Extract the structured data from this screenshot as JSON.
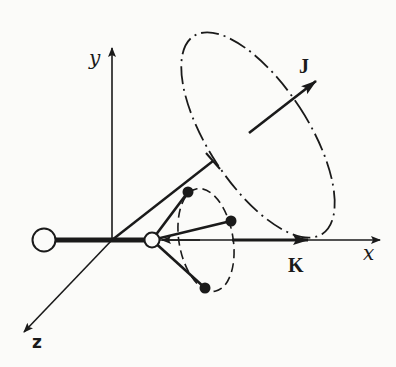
{
  "figure": {
    "labels": {
      "y_axis": "y",
      "x_axis": "x",
      "z_axis": "z",
      "angular_momentum": "J",
      "projection": "K"
    },
    "colors": {
      "ink": "#1a1a1a",
      "paper": "#fbfbf9"
    },
    "elements": {
      "axes": [
        "x",
        "y",
        "z"
      ],
      "large_atom": "open circle on negative x side",
      "central_atom": "small open circle on x axis",
      "outer_atoms": 3,
      "large_ellipse": "dash-dot precession path of J",
      "small_ellipse": "dashed rotation path of outer atoms"
    }
  }
}
